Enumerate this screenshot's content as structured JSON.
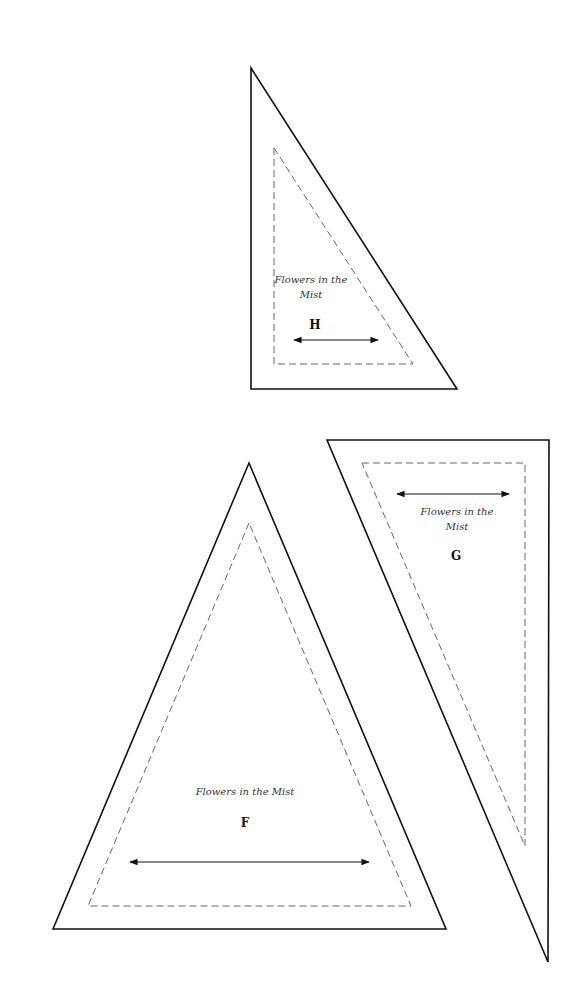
{
  "templates": [
    {
      "id": "H",
      "title_line1": "Flowers in the",
      "title_line2": "Mist",
      "letter": "H",
      "outer_points": "251,68 251,389 457,389",
      "inner_points": "274,148 274,364 413,364",
      "arrow": {
        "x1": 294,
        "y1": 340,
        "x2": 378,
        "y2": 340
      },
      "text_pos": {
        "line1": [
          311,
          283
        ],
        "line2": [
          311,
          298
        ],
        "letter": [
          315,
          328
        ]
      }
    },
    {
      "id": "G",
      "title_line1": "Flowers in the",
      "title_line2": "Mist",
      "letter": "G",
      "outer_points": "327,440 549,440 548,962",
      "inner_points": "362,463 525,463 525,846",
      "arrow": {
        "x1": 397,
        "y1": 494,
        "x2": 509,
        "y2": 494
      },
      "text_pos": {
        "line1": [
          457,
          515
        ],
        "line2": [
          457,
          530
        ],
        "letter": [
          456,
          560
        ]
      }
    },
    {
      "id": "F",
      "title_line1": "Flowers in the  Mist",
      "title_line2": "",
      "letter": "F",
      "outer_points": "249,463 53,929 446,929",
      "inner_points": "249,523 88,906 411,906",
      "arrow": {
        "x1": 130,
        "y1": 862,
        "x2": 369,
        "y2": 862
      },
      "text_pos": {
        "line1": [
          245,
          795
        ],
        "line2": [
          245,
          810
        ],
        "letter": [
          245,
          826
        ]
      }
    }
  ]
}
